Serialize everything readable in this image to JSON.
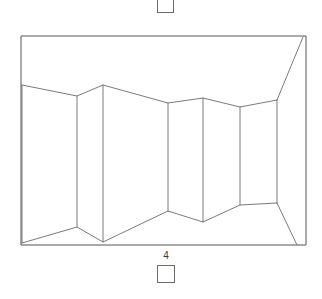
{
  "figure": {
    "label": "4",
    "domain_type": "line-drawing",
    "stroke_color": "#6b6b6b",
    "frame_stroke_color": "#555555",
    "background_color": "#ffffff",
    "label_color": "#3a3a3a",
    "canvas": {
      "width": 322,
      "height": 299
    },
    "frame": {
      "x1": 21,
      "y1": 36,
      "x2": 306,
      "y2": 245
    },
    "top_ridge": [
      [
        22,
        85
      ],
      [
        77,
        96
      ],
      [
        103,
        85
      ],
      [
        168,
        103
      ],
      [
        203,
        98
      ],
      [
        240,
        107
      ],
      [
        277,
        100
      ]
    ],
    "bottom_ridge": [
      [
        22,
        243
      ],
      [
        77,
        227
      ],
      [
        103,
        242
      ],
      [
        168,
        211
      ],
      [
        203,
        222
      ],
      [
        240,
        205
      ],
      [
        277,
        203
      ]
    ],
    "fold_lines": [
      {
        "x1": 22,
        "y1": 85,
        "x2": 22,
        "y2": 243
      },
      {
        "x1": 77,
        "y1": 96,
        "x2": 77,
        "y2": 227
      },
      {
        "x1": 103,
        "y1": 85,
        "x2": 103,
        "y2": 242
      },
      {
        "x1": 168,
        "y1": 103,
        "x2": 168,
        "y2": 211
      },
      {
        "x1": 203,
        "y1": 98,
        "x2": 203,
        "y2": 222
      },
      {
        "x1": 240,
        "y1": 107,
        "x2": 240,
        "y2": 205
      },
      {
        "x1": 277,
        "y1": 100,
        "x2": 277,
        "y2": 203
      }
    ],
    "corner_edges": [
      {
        "name": "upper-right-diagonal",
        "x1": 303,
        "y1": 37,
        "x2": 277,
        "y2": 100
      },
      {
        "name": "lower-right-diagonal",
        "x1": 277,
        "y1": 203,
        "x2": 297,
        "y2": 245
      }
    ]
  },
  "handles": {
    "top": {
      "name": "top-marker-square",
      "width": 17,
      "height": 18
    },
    "bottom": {
      "name": "bottom-marker-square",
      "width": 18,
      "height": 18
    }
  }
}
